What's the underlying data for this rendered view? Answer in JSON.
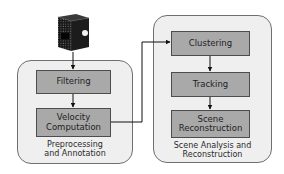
{
  "diagram": {
    "type": "pipeline-flowchart",
    "input": {
      "icon": "lidar-sensor-icon",
      "description": "3D sensor device feeding the pipeline"
    },
    "groups": [
      {
        "id": "preprocessing",
        "caption_lines": [
          "Preprocessing",
          "and Annotation"
        ],
        "stages": [
          {
            "id": "filtering",
            "lines": [
              "Filtering"
            ]
          },
          {
            "id": "velocity",
            "lines": [
              "Velocity",
              "Computation"
            ]
          }
        ]
      },
      {
        "id": "scene-analysis",
        "caption_lines": [
          "Scene Analysis and",
          "Reconstruction"
        ],
        "stages": [
          {
            "id": "clustering",
            "lines": [
              "Clustering"
            ]
          },
          {
            "id": "tracking",
            "lines": [
              "Tracking"
            ]
          },
          {
            "id": "scene-reconstruction",
            "lines": [
              "Scene",
              "Reconstruction"
            ]
          }
        ]
      }
    ],
    "edges": [
      {
        "from": "sensor",
        "to": "filtering"
      },
      {
        "from": "filtering",
        "to": "velocity"
      },
      {
        "from": "velocity",
        "to": "clustering"
      },
      {
        "from": "clustering",
        "to": "tracking"
      },
      {
        "from": "tracking",
        "to": "scene-reconstruction"
      }
    ],
    "colors": {
      "group_fill": "#efefef",
      "group_border": "#6f6f6f",
      "stage_fill": "#a9a9a9",
      "stage_border": "#4d4d4d",
      "arrow": "#111111",
      "text": "#1e1e1e"
    }
  }
}
